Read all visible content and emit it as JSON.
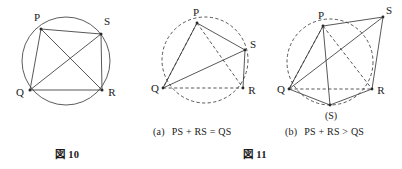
{
  "figure10": {
    "name": "Figure 10",
    "caption": "図 10",
    "vertices": [
      {
        "label": "P",
        "x": 41,
        "y": 29
      },
      {
        "label": "S",
        "x": 101,
        "y": 34
      },
      {
        "label": "Q",
        "x": 30,
        "y": 90
      },
      {
        "label": "R",
        "x": 102,
        "y": 90
      }
    ],
    "circle": {
      "cx": 66,
      "cy": 61,
      "r": 44
    },
    "solid_segments": [
      "P-S",
      "S-R",
      "R-Q",
      "Q-P",
      "P-R",
      "Q-S"
    ],
    "dashed_segments": [],
    "description": "Cyclic quadrilateral PSRQ inscribed in a circle with both diagonals drawn"
  },
  "figure11": {
    "name": "Figure 11",
    "caption": "図 11",
    "panels": [
      {
        "tag": "(a)",
        "relation": "PS + RS = QS",
        "circle": {
          "cx": 205,
          "cy": 60,
          "r": 43
        },
        "vertices": [
          {
            "label": "P",
            "x": 197,
            "y": 23
          },
          {
            "label": "S",
            "x": 245,
            "y": 50
          },
          {
            "label": "Q",
            "x": 163,
            "y": 88
          },
          {
            "label": "R",
            "x": 243,
            "y": 88
          }
        ],
        "solid_segments": [
          "P-S",
          "S-R",
          "Q-S",
          "Q-P"
        ],
        "dashed_segments": [
          "P-Q",
          "P-R",
          "Q-R"
        ],
        "note": "S lies on the circle; PS + RS equals QS"
      },
      {
        "tag": "(b)",
        "relation": "PS + RS > QS",
        "circle": {
          "cx": 330,
          "cy": 62,
          "r": 43
        },
        "vertices": [
          {
            "label": "P",
            "x": 323,
            "y": 26
          },
          {
            "label": "S",
            "x": 383,
            "y": 17
          },
          {
            "label": "Q",
            "x": 289,
            "y": 89
          },
          {
            "label": "R",
            "x": 372,
            "y": 89
          },
          {
            "label": "(S)",
            "x": 330,
            "y": 108
          }
        ],
        "solid_segments": [
          "P-S",
          "S-R",
          "Q-S",
          "Q-P",
          "P-R",
          "Q-(S)",
          "(S)-R",
          "P-(S)"
        ],
        "dashed_segments": [
          "P-Q",
          "P-R-arc",
          "Q-R"
        ],
        "note": "S lies outside the circle; PS + RS is greater than QS"
      }
    ]
  },
  "colors": {
    "stroke": "#3a3a3a",
    "circle_stroke": "#4a4a4a",
    "text": "#1a1a1a",
    "background": "#ffffff"
  }
}
